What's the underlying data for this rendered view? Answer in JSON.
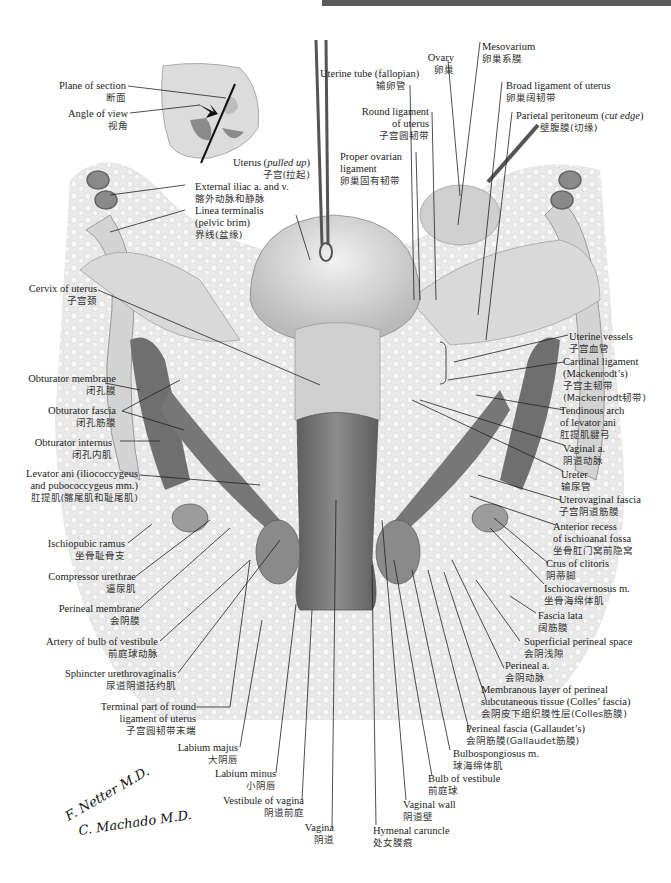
{
  "header": {
    "bar_color": "#5a5a5a"
  },
  "figure": {
    "palette": {
      "line": "#222222",
      "tissue_light": "#e6e6e6",
      "tissue_mid": "#bdbdbd",
      "tissue_dark": "#7a7a7a",
      "muscle": "#6d6d6d"
    }
  },
  "inset": {
    "plane": {
      "en": "Plane of section",
      "zh": "断面"
    },
    "angle": {
      "en": "Angle of view",
      "zh": "视角"
    }
  },
  "labels_top_left": [
    {
      "en": "Uterus (",
      "en_italic": "pulled up",
      "en_end": ")",
      "zh": "子宫(拉起)"
    },
    {
      "en": "External iliac a. and v.",
      "zh": "髂外动脉和静脉"
    },
    {
      "en": "Linea terminalis",
      "en2": "(pelvic brim)",
      "zh": "界线(盆缘)"
    }
  ],
  "labels_top_right": [
    {
      "en": "Uterine tube (fallopian)",
      "zh": "输卵管"
    },
    {
      "en": "Round ligament",
      "en2": "of uterus",
      "zh": "子宫圆韧带"
    },
    {
      "en": "Proper ovarian",
      "en2": "ligament",
      "zh": "卵巢固有韧带"
    },
    {
      "en": "Ovary",
      "zh": "卵巢"
    },
    {
      "en": "Mesovarium",
      "zh": "卵巢系膜"
    },
    {
      "en": "Broad ligament of uterus",
      "zh": "卵巢阔韧带"
    },
    {
      "en": "Parietal peritoneum (",
      "en_italic": "cut edge",
      "en_end": ")",
      "zh": "壁腹膜(切缘)"
    }
  ],
  "labels_left": [
    {
      "en": "Cervix of uterus",
      "zh": "子宫颈"
    },
    {
      "en": "Obturator membrane",
      "zh": "闭孔膜"
    },
    {
      "en": "Obturator fascia",
      "zh": "闭孔筋膜"
    },
    {
      "en": "Obturator internus",
      "zh": "闭孔内肌"
    },
    {
      "en": "Levator ani (iliococcygeus",
      "en2": "and pubococcygeus mm.)",
      "zh": "肛提肌(髂尾肌和耻尾肌)"
    },
    {
      "en": "Ischiopubic ramus",
      "zh": "坐骨耻骨支"
    },
    {
      "en": "Compressor urethrae",
      "zh": "逼尿肌"
    },
    {
      "en": "Perineal membrane",
      "zh": "会阴膜"
    },
    {
      "en": "Artery of bulb of vestibule",
      "zh": "前庭球动脉"
    },
    {
      "en": "Sphincter urethrovaginalis",
      "zh": "尿道阴道括约肌"
    },
    {
      "en": "Terminal part of round",
      "en2": "ligament of uterus",
      "zh": "子宫圆韧带末端"
    },
    {
      "en": "Labium majus",
      "zh": "大阴唇"
    },
    {
      "en": "Labium minus",
      "zh": "小阴唇"
    },
    {
      "en": "Vestibule of vagina",
      "zh": "阴道前庭"
    },
    {
      "en": "Vagina",
      "zh": "阴道"
    }
  ],
  "labels_right": [
    {
      "en": "Uterine vessels",
      "zh": "子宫血管"
    },
    {
      "en": "Cardinal ligament",
      "en2": "(Mackenrodt’s)",
      "zh": "子宫主韧带",
      "zh2": "(Mackenrodt韧带)"
    },
    {
      "en": "Tendinous arch",
      "en2": "of levator ani",
      "zh": "肛提肌腱弓"
    },
    {
      "en": "Vaginal a.",
      "zh": "阴道动脉"
    },
    {
      "en": "Ureter",
      "zh": "输尿管"
    },
    {
      "en": "Uterovaginal fascia",
      "zh": "子宫阴道筋膜"
    },
    {
      "en": "Anterior recess",
      "en2": "of ischioanal fossa",
      "zh": "坐骨肛门窝前隐窝"
    },
    {
      "en": "Crus of clitoris",
      "zh": "阴蒂脚"
    },
    {
      "en": "Ischiocavernosus m.",
      "zh": "坐骨海绵体肌"
    },
    {
      "en": "Fascia lata",
      "zh": "阔筋膜"
    },
    {
      "en": "Superficial perineal space",
      "zh": "会阴浅隙"
    },
    {
      "en": "Perineal a.",
      "zh": "会阴动脉"
    },
    {
      "en": "Membranous layer of perineal",
      "en2": "subcutaneous tissue (Colles’ fascia)",
      "zh": "会阴皮下组织膜性层(Colles筋膜)"
    },
    {
      "en": "Perineal fascia (Gallaudet’s)",
      "zh": "会阴筋膜(Gallaudet筋膜)"
    },
    {
      "en": "Bulbospongiosus m.",
      "zh": "球海绵体肌"
    },
    {
      "en": "Bulb of vestibule",
      "zh": "前庭球"
    },
    {
      "en": "Vaginal wall",
      "zh": "阴道壁"
    },
    {
      "en": "Hymenal caruncle",
      "zh": "处女膜痕"
    }
  ],
  "signatures": {
    "first": "F. Netter M.D.",
    "second": "C. Machado M.D."
  }
}
